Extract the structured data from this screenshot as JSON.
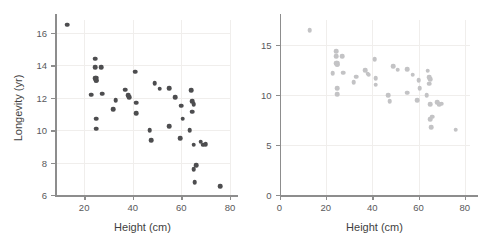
{
  "figure": {
    "background": "#ffffff",
    "panel_count": 2
  },
  "chart_data": [
    {
      "type": "scatter",
      "title": "",
      "xlabel": "Height (cm)",
      "ylabel": "Longevity (yr)",
      "xlim": [
        8,
        80
      ],
      "ylim": [
        6,
        16.8
      ],
      "xticks": [
        20,
        40,
        60,
        80
      ],
      "yticks": [
        6,
        8,
        10,
        12,
        14,
        16
      ],
      "grid": true,
      "legend": "none",
      "marker_color": "#4d4d4f",
      "x": [
        13,
        23,
        24.5,
        24.5,
        24.5,
        25,
        25,
        25,
        25,
        25,
        27,
        27.5,
        32,
        33,
        37,
        38,
        38.5,
        41,
        41.5,
        41.5,
        47,
        47.5,
        49,
        51,
        55,
        55,
        57.5,
        59.5,
        60,
        60.5,
        63.5,
        64,
        64.5,
        64.5,
        65,
        65,
        65,
        65.5,
        66,
        68,
        69,
        70,
        76
      ],
      "y": [
        16.5,
        12.2,
        14.4,
        13.9,
        13.2,
        13.25,
        13.1,
        13.05,
        10.7,
        10.1,
        13.9,
        12.25,
        11.3,
        11.85,
        12.5,
        12.15,
        12.05,
        13.6,
        11.7,
        11.05,
        10.0,
        9.4,
        12.9,
        12.55,
        12.6,
        10.25,
        12.05,
        9.5,
        11.5,
        10.7,
        10.0,
        12.45,
        11.15,
        11.8,
        11.6,
        9.1,
        7.6,
        6.8,
        7.85,
        9.3,
        9.1,
        9.15,
        6.55
      ]
    },
    {
      "type": "scatter",
      "title": "",
      "xlabel": "Height (cm)",
      "ylabel": "",
      "xlim": [
        0,
        82
      ],
      "ylim": [
        0,
        17.5
      ],
      "xticks": [
        0,
        20,
        40,
        60,
        80
      ],
      "yticks": [
        0,
        5,
        10,
        15
      ],
      "grid": true,
      "legend": "none",
      "marker_color": "#c3c3c5",
      "x": [
        13,
        23,
        24.5,
        24.5,
        24.5,
        25,
        25,
        25,
        25,
        25,
        27,
        27.5,
        32,
        33,
        37,
        38,
        38.5,
        41,
        41.5,
        41.5,
        47,
        47.5,
        49,
        51,
        55,
        55,
        57.5,
        59.5,
        60,
        60.5,
        63.5,
        64,
        64.5,
        64.5,
        65,
        65,
        65,
        65.5,
        66,
        68,
        69,
        70,
        76
      ],
      "y": [
        16.5,
        12.2,
        14.4,
        13.9,
        13.2,
        13.25,
        13.1,
        13.05,
        10.7,
        10.1,
        13.9,
        12.25,
        11.3,
        11.85,
        12.5,
        12.15,
        12.05,
        13.6,
        11.7,
        11.05,
        10.0,
        9.4,
        12.9,
        12.55,
        12.6,
        10.25,
        12.05,
        9.5,
        11.5,
        10.7,
        10.0,
        12.45,
        11.15,
        11.8,
        11.6,
        9.1,
        7.6,
        6.8,
        7.85,
        9.3,
        9.1,
        9.15,
        6.55
      ]
    }
  ]
}
